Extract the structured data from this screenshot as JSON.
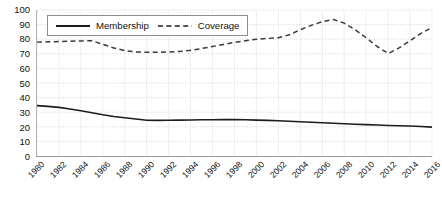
{
  "chart_data": {
    "type": "line",
    "title": "",
    "xlabel": "",
    "ylabel": "",
    "xlim": [
      1980,
      2016
    ],
    "ylim": [
      0,
      100
    ],
    "ytick_step": 10,
    "grid": true,
    "grid_style": "dotted",
    "legend_position": "top-left",
    "x": [
      1980,
      1981,
      1982,
      1983,
      1984,
      1985,
      1986,
      1987,
      1988,
      1989,
      1990,
      1991,
      1992,
      1993,
      1994,
      1995,
      1996,
      1997,
      1998,
      1999,
      2000,
      2001,
      2002,
      2003,
      2004,
      2005,
      2006,
      2007,
      2008,
      2009,
      2010,
      2011,
      2012,
      2013,
      2014,
      2015,
      2016
    ],
    "yticks": [
      0,
      10,
      20,
      30,
      40,
      50,
      60,
      70,
      80,
      90,
      100
    ],
    "xticks": [
      1980,
      1982,
      1984,
      1986,
      1988,
      1990,
      1992,
      1994,
      1996,
      1998,
      2000,
      2002,
      2004,
      2006,
      2008,
      2010,
      2012,
      2014,
      2016
    ],
    "xtick_labels": [
      "1980",
      "1982",
      "1984",
      "1986",
      "1988",
      "1990",
      "1992",
      "1994",
      "1996",
      "1998",
      "2000",
      "2002",
      "2004",
      "2006",
      "2008",
      "2010",
      "2012",
      "2014",
      "2016"
    ],
    "series": [
      {
        "name": "Membership",
        "style": "solid",
        "color": "#1c1c1c",
        "values": [
          34.5,
          34.0,
          33.3,
          32.2,
          31.0,
          29.6,
          28.3,
          27.1,
          26.2,
          25.3,
          24.5,
          24.4,
          24.5,
          24.6,
          24.7,
          24.8,
          24.8,
          24.9,
          24.9,
          24.8,
          24.6,
          24.4,
          24.1,
          23.8,
          23.5,
          23.1,
          22.8,
          22.4,
          22.1,
          21.8,
          21.5,
          21.2,
          20.9,
          20.7,
          20.5,
          20.2,
          19.8
        ]
      },
      {
        "name": "Coverage",
        "style": "dashed",
        "color": "#3a3a3a",
        "values": [
          78.0,
          78.2,
          78.4,
          78.6,
          78.8,
          79.0,
          76.5,
          74.0,
          72.2,
          71.3,
          71.0,
          71.0,
          71.2,
          71.6,
          72.4,
          73.6,
          75.0,
          76.4,
          77.8,
          79.0,
          80.0,
          80.5,
          81.0,
          83.0,
          86.5,
          89.5,
          92.0,
          93.5,
          91.0,
          86.5,
          81.0,
          75.0,
          70.2,
          74.0,
          79.0,
          84.0,
          88.0
        ]
      }
    ],
    "series_extended_note": ""
  },
  "legend": {
    "entries": [
      {
        "label": "Membership",
        "style": "solid"
      },
      {
        "label": "Coverage",
        "style": "dashed"
      }
    ]
  }
}
